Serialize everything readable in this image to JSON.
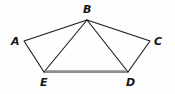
{
  "figure": {
    "name": "pentagon-abcde-with-diagonals",
    "background_color": "#fdfdfd",
    "line_color": "#1a1a1a",
    "highlight_color": "#8c8c8c",
    "label_color": "#141414",
    "labels": {
      "a": "A",
      "b": "B",
      "c": "C",
      "d": "D",
      "e": "E"
    },
    "vertices": {
      "A": {
        "x": 24,
        "y": 41
      },
      "B": {
        "x": 87,
        "y": 20
      },
      "C": {
        "x": 150,
        "y": 41
      },
      "D": {
        "x": 128,
        "y": 72
      },
      "E": {
        "x": 44,
        "y": 72
      }
    },
    "label_positions": {
      "A": {
        "x": 11,
        "y": 45
      },
      "B": {
        "x": 83,
        "y": 13
      },
      "C": {
        "x": 154,
        "y": 45
      },
      "D": {
        "x": 126,
        "y": 86
      },
      "E": {
        "x": 40,
        "y": 86
      }
    },
    "edges": [
      {
        "name": "edge-ab",
        "from": "A",
        "to": "B"
      },
      {
        "name": "edge-bc",
        "from": "B",
        "to": "C"
      },
      {
        "name": "edge-cd",
        "from": "C",
        "to": "D"
      },
      {
        "name": "edge-de",
        "from": "D",
        "to": "E"
      },
      {
        "name": "edge-ea",
        "from": "E",
        "to": "A"
      }
    ],
    "diagonals": [
      {
        "name": "diagonal-be",
        "from": "B",
        "to": "E"
      },
      {
        "name": "diagonal-bd",
        "from": "B",
        "to": "D"
      }
    ],
    "highlighted_segment": {
      "name": "segment-ed",
      "from": "E",
      "to": "D"
    }
  }
}
